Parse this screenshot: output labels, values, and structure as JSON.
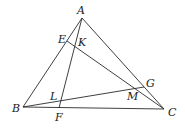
{
  "diagram": {
    "type": "geometry-triangle",
    "points": {
      "A": {
        "label": "A",
        "x": 82,
        "y": 18,
        "lx": 77,
        "ly": 14
      },
      "B": {
        "label": "B",
        "x": 23,
        "y": 107,
        "lx": 12,
        "ly": 112
      },
      "C": {
        "label": "C",
        "x": 164,
        "y": 109,
        "lx": 168,
        "ly": 116
      },
      "E": {
        "label": "E",
        "x": 67,
        "y": 41,
        "lx": 58,
        "ly": 43
      },
      "F": {
        "label": "F",
        "x": 59,
        "y": 108,
        "lx": 55,
        "ly": 121
      },
      "G": {
        "label": "G",
        "x": 144,
        "y": 87,
        "lx": 146,
        "ly": 87
      },
      "K": {
        "label": "K",
        "x": 75,
        "y": 46,
        "lx": 78,
        "ly": 46
      },
      "L": {
        "label": "L",
        "x": 61,
        "y": 101,
        "lx": 50,
        "ly": 100
      },
      "M": {
        "label": "M",
        "x": 137,
        "y": 89,
        "lx": 127,
        "ly": 100
      }
    },
    "segments": [
      {
        "name": "segment-AB",
        "from": "A",
        "to": "B"
      },
      {
        "name": "segment-BC",
        "from": "B",
        "to": "C"
      },
      {
        "name": "segment-CA",
        "from": "C",
        "to": "A"
      },
      {
        "name": "segment-AF",
        "from": "A",
        "to": "F"
      },
      {
        "name": "segment-EC",
        "from": "E",
        "to": "C"
      },
      {
        "name": "segment-BG",
        "from": "B",
        "to": "G"
      }
    ]
  }
}
